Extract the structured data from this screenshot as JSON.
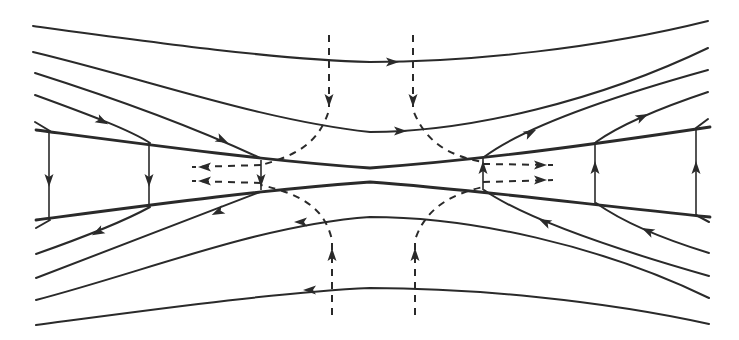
{
  "diagram": {
    "title": "",
    "width": 739,
    "height": 340,
    "background": "#ffffff",
    "ink": "#2a2a2a",
    "separatrices": [
      {
        "name": "upper-separatrix",
        "d": "M36 130 C 150 145, 260 160, 370 168 C 480 160, 590 145, 710 127"
      },
      {
        "name": "lower-separatrix",
        "d": "M36 220 C 150 205, 260 190, 370 182 C 480 190, 590 205, 710 217"
      }
    ],
    "field_lines": [
      {
        "name": "top-line-1",
        "d": "M33 26 C 150 42, 280 60, 370 62 C 470 62, 600 48, 708 21"
      },
      {
        "name": "top-line-2",
        "d": "M33 52 C 150 80, 260 120, 370 132 C 470 132, 600 100, 708 48"
      },
      {
        "name": "top-line-3",
        "d": "M35 73 C 120 100, 200 130, 260 158"
      },
      {
        "name": "top-line-4",
        "d": "M35 95 C 90 115, 130 130, 150 143"
      },
      {
        "name": "top-line-5",
        "d": "M35 122 L 50 131"
      },
      {
        "name": "top-right-line-3",
        "d": "M484 157 C 520 130, 600 100, 708 70"
      },
      {
        "name": "top-right-line-4",
        "d": "M596 142 C 620 125, 660 108, 708 92"
      },
      {
        "name": "top-right-line-5",
        "d": "M696 128 L 708 119"
      },
      {
        "name": "bottom-line-1",
        "d": "M36 325 C 150 310, 280 292, 370 288 C 470 288, 600 300, 709 324"
      },
      {
        "name": "bottom-line-2",
        "d": "M36 300 C 150 270, 260 225, 370 217 C 470 217, 600 245, 709 298"
      },
      {
        "name": "bottom-line-3",
        "d": "M36 278 C 120 245, 200 215, 260 192"
      },
      {
        "name": "bottom-line-4",
        "d": "M36 254 C 90 235, 130 218, 150 207"
      },
      {
        "name": "bottom-line-5",
        "d": "M36 228 L 50 220"
      },
      {
        "name": "bottom-right-line-3",
        "d": "M484 190 C 520 215, 600 245, 709 276"
      },
      {
        "name": "bottom-right-line-4",
        "d": "M596 203 C 620 220, 660 238, 709 253"
      },
      {
        "name": "bottom-right-line-5",
        "d": "M696 215 L 709 222"
      }
    ],
    "vertical_links": [
      {
        "name": "left-outer-link",
        "x": 49,
        "y1": 131,
        "y2": 220,
        "dir": "down"
      },
      {
        "name": "left-mid-link",
        "x": 149,
        "y1": 143,
        "y2": 207,
        "dir": "down"
      },
      {
        "name": "left-inner-link",
        "x": 261,
        "y1": 160,
        "y2": 190,
        "dir": "down"
      },
      {
        "name": "right-inner-link",
        "x": 483,
        "y1": 158,
        "y2": 190,
        "dir": "up"
      },
      {
        "name": "right-mid-link",
        "x": 595,
        "y1": 142,
        "y2": 204,
        "dir": "up"
      },
      {
        "name": "right-outer-link",
        "x": 696,
        "y1": 128,
        "y2": 216,
        "dir": "up"
      }
    ],
    "dashed_flows": [
      {
        "name": "inflow-top-left",
        "d": "M329 35 L 329 110 C 320 140, 300 155, 261 165"
      },
      {
        "name": "inflow-top-right",
        "d": "M413 35 L 413 110 C 425 140, 445 155, 483 162"
      },
      {
        "name": "inflow-bottom-left",
        "d": "M332 315 L 332 240 C 325 210, 305 195, 261 185"
      },
      {
        "name": "inflow-bottom-right",
        "d": "M415 315 L 415 240 C 425 210, 448 195, 483 187"
      },
      {
        "name": "outflow-left-upper",
        "d": "M261 165 L 192 167"
      },
      {
        "name": "outflow-left-lower",
        "d": "M261 183 L 192 181"
      },
      {
        "name": "outflow-right-upper",
        "d": "M483 164 L 553 165"
      },
      {
        "name": "outflow-right-lower",
        "d": "M483 182 L 553 180"
      }
    ],
    "arrows": [
      {
        "name": "arrow-top-line-1",
        "x": 392,
        "y": 62,
        "angle": 0
      },
      {
        "name": "arrow-top-line-2",
        "x": 400,
        "y": 131,
        "angle": 0
      },
      {
        "name": "arrow-top-line-3",
        "x": 222,
        "y": 140,
        "angle": 26
      },
      {
        "name": "arrow-top-line-4",
        "x": 102,
        "y": 121,
        "angle": 28
      },
      {
        "name": "arrow-top-right-3",
        "x": 530,
        "y": 133,
        "angle": -28
      },
      {
        "name": "arrow-top-right-4",
        "x": 642,
        "y": 117,
        "angle": -26
      },
      {
        "name": "arrow-bottom-line-1",
        "x": 310,
        "y": 290,
        "angle": 180
      },
      {
        "name": "arrow-bottom-line-2",
        "x": 301,
        "y": 222,
        "angle": 180
      },
      {
        "name": "arrow-bottom-line-3",
        "x": 218,
        "y": 212,
        "angle": 154
      },
      {
        "name": "arrow-bottom-line-4",
        "x": 98,
        "y": 232,
        "angle": 152
      },
      {
        "name": "arrow-bottom-right-3",
        "x": 545,
        "y": 222,
        "angle": 206
      },
      {
        "name": "arrow-bottom-right-4",
        "x": 648,
        "y": 231,
        "angle": 206
      },
      {
        "name": "arrow-inflow-top-left",
        "x": 329,
        "y": 100,
        "angle": 90
      },
      {
        "name": "arrow-inflow-top-right",
        "x": 413,
        "y": 100,
        "angle": 90
      },
      {
        "name": "arrow-inflow-bottom-left",
        "x": 332,
        "y": 255,
        "angle": -90
      },
      {
        "name": "arrow-inflow-bottom-right",
        "x": 415,
        "y": 255,
        "angle": -90
      },
      {
        "name": "arrow-outflow-left-upper",
        "x": 205,
        "y": 167,
        "angle": 180
      },
      {
        "name": "arrow-outflow-left-lower",
        "x": 205,
        "y": 181,
        "angle": 180
      },
      {
        "name": "arrow-outflow-right-upper",
        "x": 540,
        "y": 165,
        "angle": 0
      },
      {
        "name": "arrow-outflow-right-lower",
        "x": 540,
        "y": 180,
        "angle": 0
      },
      {
        "name": "arrow-left-outer-link",
        "x": 49,
        "y": 180,
        "angle": 90
      },
      {
        "name": "arrow-left-mid-link",
        "x": 149,
        "y": 180,
        "angle": 90
      },
      {
        "name": "arrow-left-inner-link",
        "x": 261,
        "y": 180,
        "angle": 90
      },
      {
        "name": "arrow-right-inner-link",
        "x": 483,
        "y": 168,
        "angle": -90
      },
      {
        "name": "arrow-right-mid-link",
        "x": 595,
        "y": 168,
        "angle": -90
      },
      {
        "name": "arrow-right-outer-link",
        "x": 696,
        "y": 168,
        "angle": -90
      }
    ]
  }
}
